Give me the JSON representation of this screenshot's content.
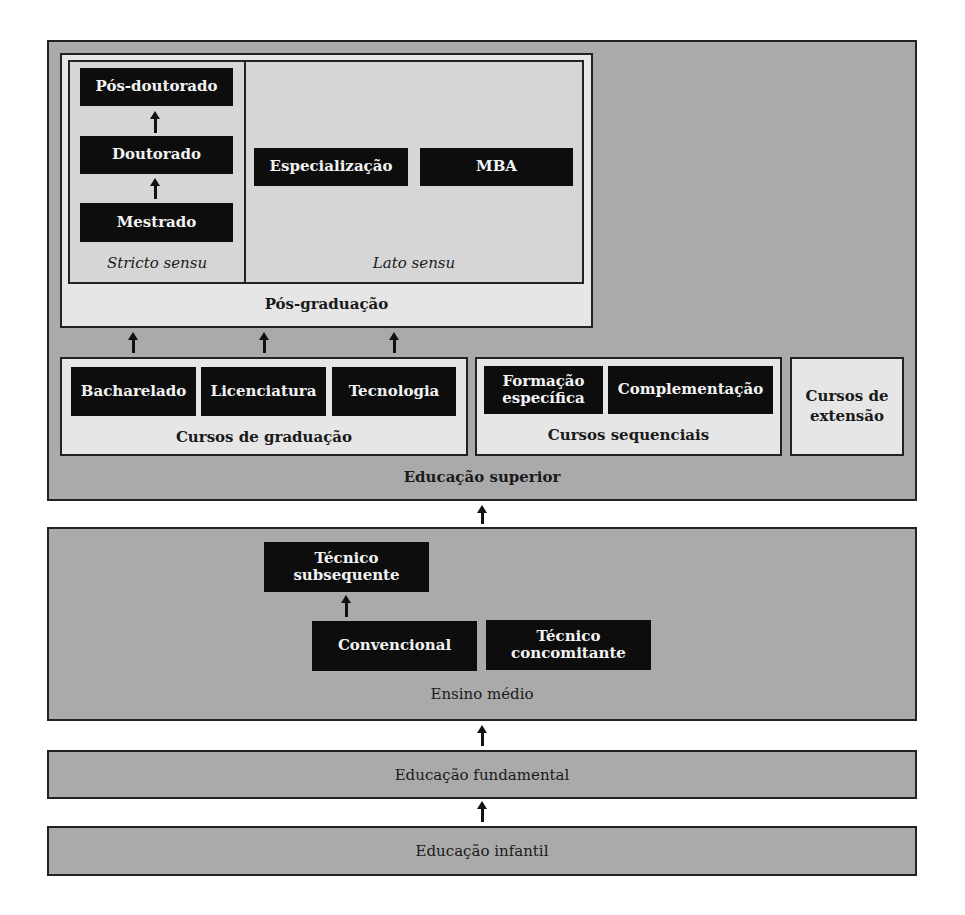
{
  "diagram": {
    "educacao_superior": {
      "label": "Educação superior",
      "pos_graduacao": {
        "label": "Pós-graduação",
        "stricto_sensu": {
          "label": "Stricto sensu",
          "items": [
            "Pós-doutorado",
            "Doutorado",
            "Mestrado"
          ]
        },
        "lato_sensu": {
          "label": "Lato sensu",
          "items": [
            "Especialização",
            "MBA"
          ]
        }
      },
      "cursos_graduacao": {
        "label": "Cursos de graduação",
        "items": [
          "Bacharelado",
          "Licenciatura",
          "Tecnologia"
        ]
      },
      "cursos_sequenciais": {
        "label": "Cursos sequenciais",
        "items": [
          {
            "line1": "Formação",
            "line2": "específica"
          },
          {
            "line1": "Complementação"
          }
        ]
      },
      "cursos_extensao": {
        "line1": "Cursos de",
        "line2": "extensão"
      }
    },
    "ensino_medio": {
      "label": "Ensino médio",
      "tecnico_subsequente": {
        "line1": "Técnico",
        "line2": "subsequente"
      },
      "convencional": "Convencional",
      "tecnico_concomitante": {
        "line1": "Técnico",
        "line2": "concomitante"
      }
    },
    "educacao_fundamental": {
      "label": "Educação fundamental"
    },
    "educacao_infantil": {
      "label": "Educação infantil"
    },
    "colors": {
      "outer_gray": "#aaaaaa",
      "light_box": "#e6e6e6",
      "inner_box": "#d6d6d6",
      "black_box": "#0d0d0d",
      "border": "#222222"
    }
  }
}
